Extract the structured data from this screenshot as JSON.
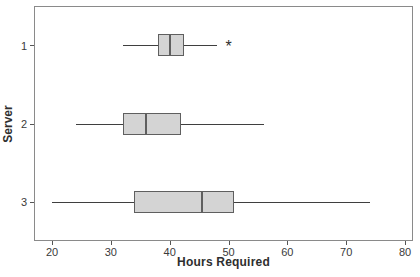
{
  "chart_data": {
    "type": "boxplot",
    "orientation": "horizontal",
    "title": "",
    "xlabel": "Hours Required",
    "ylabel": "Server",
    "x_ticks": [
      20,
      30,
      40,
      50,
      60,
      70,
      80
    ],
    "xlim": [
      20,
      80
    ],
    "categories": [
      "1",
      "2",
      "3"
    ],
    "series": [
      {
        "category": "1",
        "whisker_low": 32,
        "q1": 38,
        "median": 40,
        "q3": 42.5,
        "whisker_high": 48,
        "outliers": [
          50
        ]
      },
      {
        "category": "2",
        "whisker_low": 24,
        "q1": 32,
        "median": 36,
        "q3": 42,
        "whisker_high": 56,
        "outliers": []
      },
      {
        "category": "3",
        "whisker_low": 20,
        "q1": 34,
        "median": 45.5,
        "q3": 51,
        "whisker_high": 74,
        "outliers": []
      }
    ],
    "legend": null,
    "grid": false,
    "colors": {
      "box_fill": "#d4d4d4",
      "box_border": "#5f5f5f",
      "whisker": "#3f3f3f",
      "frame": "#8a8a8a",
      "text": "#2e2e2e"
    },
    "outlier_symbol": "*"
  }
}
